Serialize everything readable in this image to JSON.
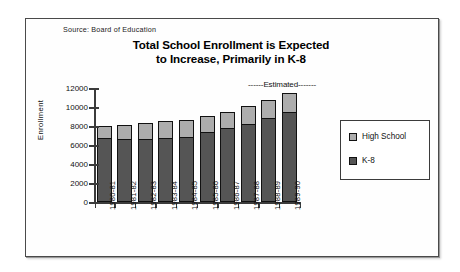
{
  "source_note": "Source:  Board of Education",
  "title_line1": "Total School Enrollment is Expected",
  "title_line2": "to Increase, Primarily in K-8",
  "annotation": "------Estimated-------",
  "legend": {
    "high_school": "High School",
    "k8": "K-8"
  },
  "colors": {
    "high_school": "#adadad",
    "k8": "#555555",
    "axis": "#3b3b3b",
    "outline": "#111111",
    "background": "#ffffff"
  },
  "chart_data": {
    "type": "bar",
    "title": "Total School Enrollment is Expected to Increase, Primarily in K-8",
    "subtitle": "Source:  Board of Education",
    "stacked": true,
    "xlabel": "",
    "ylabel": "Enrollment",
    "ylim": [
      0,
      12000
    ],
    "yticks": [
      0,
      2000,
      4000,
      6000,
      8000,
      10000,
      12000
    ],
    "ytick_labels": [
      "0",
      "2000",
      "4000",
      "6000",
      "8000",
      "10000",
      "12000"
    ],
    "grid": false,
    "legend_position": "right",
    "annotations": [
      {
        "text": "------Estimated-------",
        "covers": [
          "1987-88",
          "1988-89",
          "1989-90"
        ]
      }
    ],
    "categories": [
      "1980-81",
      "1981-82",
      "1982-83",
      "1983-84",
      "1984-85",
      "1985-86",
      "1986-87",
      "1987-88",
      "1988-89",
      "1989-90"
    ],
    "series": [
      {
        "name": "K-8",
        "color": "#555555",
        "values": [
          6700,
          6650,
          6600,
          6750,
          6800,
          7350,
          7800,
          8200,
          8800,
          9500
        ]
      },
      {
        "name": "High School",
        "color": "#adadad",
        "values": [
          1250,
          1450,
          1700,
          1750,
          1800,
          1750,
          1700,
          1950,
          1950,
          1950
        ]
      }
    ],
    "totals": [
      7950,
      8100,
      8300,
      8500,
      8600,
      9100,
      9500,
      10150,
      10750,
      11450
    ]
  }
}
